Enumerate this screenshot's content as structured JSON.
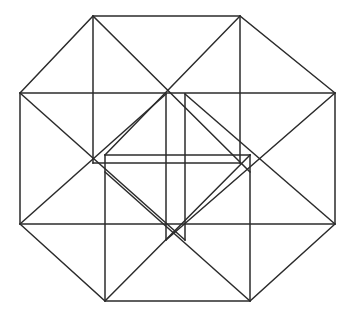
{
  "figure": {
    "title": "Tesseract (4-dimensional hypercube) orthographic line projection",
    "kind": "geometric-line-drawing",
    "background_color": "#ffffff",
    "line_color": "#2b2b2b",
    "line_width": 1.5,
    "canvas": {
      "width": 355,
      "height": 321
    },
    "vertex_count": 16,
    "edge_count": 32,
    "groups": [
      {
        "name": "outer-square-axis-aligned",
        "role": "large front cube face",
        "points": "93,16 240,16 240,163 93,163"
      },
      {
        "name": "outer-square-rotated",
        "role": "large rear cube face offset",
        "points": "20,93 335,93 335,224 20,224"
      },
      {
        "name": "mid-square-lower",
        "role": "second cube front face",
        "points": "105,301 250,301 250,155 105,155"
      },
      {
        "name": "inner-square-small-upper",
        "role": "innermost cube face upper",
        "points": "166,94 185,94 185,240 166,240"
      }
    ],
    "vertices": [
      {
        "id": "v1",
        "x": 93,
        "y": 16
      },
      {
        "id": "v2",
        "x": 240,
        "y": 16
      },
      {
        "id": "v3",
        "x": 335,
        "y": 93
      },
      {
        "id": "v4",
        "x": 335,
        "y": 224
      },
      {
        "id": "v5",
        "x": 250,
        "y": 301
      },
      {
        "id": "v6",
        "x": 105,
        "y": 301
      },
      {
        "id": "v7",
        "x": 20,
        "y": 224
      },
      {
        "id": "v8",
        "x": 20,
        "y": 93
      },
      {
        "id": "v9",
        "x": 166,
        "y": 94
      },
      {
        "id": "v10",
        "x": 185,
        "y": 94
      },
      {
        "id": "v11",
        "x": 250,
        "y": 172
      },
      {
        "id": "v12",
        "x": 250,
        "y": 155
      },
      {
        "id": "v13",
        "x": 185,
        "y": 240
      },
      {
        "id": "v14",
        "x": 166,
        "y": 240
      },
      {
        "id": "v15",
        "x": 105,
        "y": 155
      },
      {
        "id": "v16",
        "x": 105,
        "y": 172
      }
    ],
    "edges": [
      {
        "name": "outer-top-edge",
        "from": "93,16",
        "to": "240,16"
      },
      {
        "name": "outer-upper-right-diagonal",
        "from": "240,16",
        "to": "335,93"
      },
      {
        "name": "outer-right-edge",
        "from": "335,93",
        "to": "335,224"
      },
      {
        "name": "outer-lower-right-diagonal",
        "from": "335,224",
        "to": "250,301"
      },
      {
        "name": "outer-bottom-edge",
        "from": "250,301",
        "to": "105,301"
      },
      {
        "name": "outer-lower-left-diagonal",
        "from": "105,301",
        "to": "20,224"
      },
      {
        "name": "outer-left-edge",
        "from": "20,224",
        "to": "20,93"
      },
      {
        "name": "outer-upper-left-diagonal",
        "from": "20,93",
        "to": "93,16"
      },
      {
        "name": "square-a-left-vertical",
        "from": "93,16",
        "to": "93,163"
      },
      {
        "name": "square-a-right-vertical",
        "from": "240,16",
        "to": "240,163"
      },
      {
        "name": "square-a-bottom",
        "from": "93,163",
        "to": "240,163"
      },
      {
        "name": "square-b-top-horizontal",
        "from": "20,93",
        "to": "335,93"
      },
      {
        "name": "square-b-bottom-horizontal",
        "from": "20,224",
        "to": "335,224"
      },
      {
        "name": "square-c-left-vertical",
        "from": "105,155",
        "to": "105,301"
      },
      {
        "name": "square-c-right-vertical",
        "from": "250,155",
        "to": "250,301"
      },
      {
        "name": "square-c-top",
        "from": "105,155",
        "to": "250,155"
      },
      {
        "name": "inner-square-left-vertical",
        "from": "166,94",
        "to": "166,240"
      },
      {
        "name": "inner-square-right-vertical",
        "from": "185,94",
        "to": "185,240"
      },
      {
        "name": "diag-tl-to-center-right",
        "from": "93,16",
        "to": "250,172"
      },
      {
        "name": "diag-tr-to-center-left",
        "from": "240,16",
        "to": "105,155"
      },
      {
        "name": "diag-bl-to-center-right",
        "from": "105,301",
        "to": "250,155"
      },
      {
        "name": "diag-br-to-center-left",
        "from": "250,301",
        "to": "105,172"
      },
      {
        "name": "diag-left-upper",
        "from": "20,93",
        "to": "185,240"
      },
      {
        "name": "diag-left-lower",
        "from": "20,224",
        "to": "166,94"
      },
      {
        "name": "diag-right-upper",
        "from": "335,93",
        "to": "166,240"
      },
      {
        "name": "diag-right-lower",
        "from": "335,224",
        "to": "185,94"
      }
    ]
  }
}
